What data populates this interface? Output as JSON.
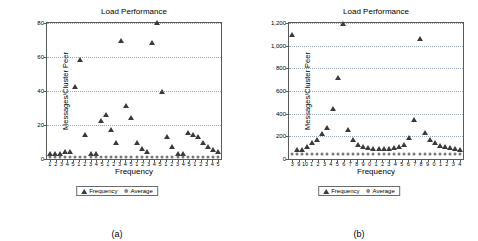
{
  "figure": {
    "caption_a": "(a)",
    "caption_b": "(b)"
  },
  "legend": {
    "series1": "Frequency",
    "series2": "Average"
  },
  "chart_data": [
    {
      "type": "scatter",
      "panel": "(a)",
      "title": "Load Performance",
      "xlabel": "Frequency",
      "ylabel": "Messages/Cluster Peer",
      "ylim": [
        0,
        80
      ],
      "yticks": [
        0,
        20,
        40,
        60,
        80
      ],
      "ytick_labels": [
        "0",
        "20",
        "40",
        "60",
        "80"
      ],
      "grid": true,
      "legend_position": "below-axes",
      "xtick_labels": [
        "1",
        "2",
        "3",
        "4",
        "5",
        "1",
        "2",
        "3",
        "4",
        "5",
        "1",
        "2",
        "3",
        "4",
        "5",
        "1",
        "2",
        "3",
        "4",
        "5",
        "1",
        "2",
        "3",
        "4",
        "5",
        "1",
        "2",
        "3",
        "4",
        "5"
      ],
      "series": [
        {
          "name": "Frequency",
          "marker": "triangle",
          "values": [
            2,
            2,
            2,
            3,
            3,
            41,
            57,
            13,
            2,
            2,
            21,
            25,
            16,
            8,
            68,
            30,
            23,
            8,
            5,
            3,
            67,
            79,
            38,
            12,
            6,
            2,
            2,
            14,
            13,
            12,
            8,
            6,
            4,
            3
          ]
        },
        {
          "name": "Average",
          "marker": "circle",
          "values": [
            1,
            1,
            1,
            1,
            1,
            1,
            1,
            1,
            1,
            1,
            1,
            1,
            1,
            1,
            1,
            1,
            1,
            1,
            1,
            1,
            1,
            1,
            1,
            1,
            1,
            1,
            1,
            1,
            1,
            1,
            1,
            1,
            1,
            1
          ]
        }
      ]
    },
    {
      "type": "scatter",
      "panel": "(b)",
      "title": "Load Performance",
      "xlabel": "Frequency",
      "ylabel": "Messages/Cluster Peer",
      "ylim": [
        0,
        1200
      ],
      "yticks": [
        0,
        200,
        400,
        600,
        800,
        1000,
        1200
      ],
      "ytick_labels": [
        "0",
        "200",
        "400",
        "600",
        "800",
        "1,000",
        "1,200"
      ],
      "grid": true,
      "legend_position": "below-axes",
      "xtick_labels": [
        "3",
        "9",
        "10",
        "1",
        "2",
        "3",
        "4",
        "5",
        "6",
        "7",
        "8",
        "9",
        "0",
        "1",
        "2",
        "3",
        "4",
        "5",
        "6",
        "7",
        "8",
        "9",
        "0",
        "1",
        "2",
        "3",
        "4"
      ],
      "series": [
        {
          "name": "Frequency",
          "marker": "triangle",
          "values": [
            1080,
            60,
            60,
            90,
            120,
            150,
            200,
            260,
            420,
            700,
            1170,
            240,
            150,
            110,
            90,
            80,
            75,
            70,
            70,
            75,
            80,
            90,
            110,
            170,
            330,
            1040,
            210,
            150,
            120,
            100,
            90,
            80,
            70,
            60
          ]
        },
        {
          "name": "Average",
          "marker": "circle",
          "values": [
            40,
            40,
            40,
            40,
            40,
            40,
            40,
            40,
            40,
            40,
            40,
            40,
            40,
            40,
            40,
            40,
            40,
            40,
            40,
            40,
            40,
            40,
            40,
            40,
            40,
            40,
            40,
            40,
            40,
            40,
            40,
            40,
            40,
            40
          ]
        }
      ]
    }
  ]
}
